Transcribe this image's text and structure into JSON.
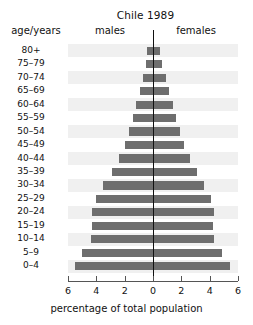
{
  "chart_data": {
    "type": "bar",
    "subtype": "population-pyramid",
    "title": "Chile 1989",
    "xlabel": "percentage of total population",
    "ylabel": "age/years",
    "categories": [
      "0–4",
      "5–9",
      "10–14",
      "15–19",
      "20–24",
      "25–29",
      "30–34",
      "35–39",
      "40–44",
      "45–49",
      "50–54",
      "55–59",
      "60–64",
      "65–69",
      "70–74",
      "75–79",
      "80+"
    ],
    "series": [
      {
        "name": "males",
        "side": "left",
        "values": [
          5.5,
          5.0,
          4.4,
          4.3,
          4.3,
          4.0,
          3.5,
          2.9,
          2.4,
          2.0,
          1.7,
          1.4,
          1.2,
          0.9,
          0.7,
          0.5,
          0.4
        ]
      },
      {
        "name": "females",
        "side": "right",
        "values": [
          5.4,
          4.9,
          4.3,
          4.2,
          4.3,
          4.1,
          3.6,
          3.1,
          2.6,
          2.2,
          1.9,
          1.6,
          1.4,
          1.1,
          0.9,
          0.6,
          0.5
        ]
      }
    ],
    "xticks": [
      6,
      4,
      2,
      0,
      2,
      4,
      6
    ],
    "xtick_labels": [
      "6",
      "4",
      "2",
      "0",
      "2",
      "4",
      "6"
    ],
    "xlim": [
      -6,
      6
    ],
    "grid": false,
    "legend_position": "top-inline",
    "bar_color": "#6e6e6e",
    "band_color": "#f0f0f0"
  },
  "header": {
    "title": "Chile 1989",
    "axis_label_head": "age/years",
    "males_label": "males",
    "females_label": "females"
  },
  "axis": {
    "xlabel": "percentage of total population"
  }
}
